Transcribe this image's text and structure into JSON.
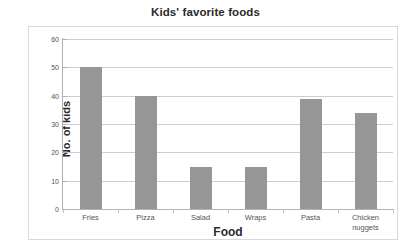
{
  "chart_data": {
    "type": "bar",
    "title": "Kids' favorite foods",
    "xlabel": "Food",
    "ylabel": "No. of kids",
    "categories": [
      "Fries",
      "Pizza",
      "Salad",
      "Wraps",
      "Pasta",
      "Chicken nuggets"
    ],
    "category_lines": [
      [
        "Fries"
      ],
      [
        "Pizza"
      ],
      [
        "Salad"
      ],
      [
        "Wraps"
      ],
      [
        "Pasta"
      ],
      [
        "Chicken",
        "nuggets"
      ]
    ],
    "values": [
      50,
      40,
      15,
      15,
      39,
      34
    ],
    "ylim": [
      0,
      60
    ],
    "ytick_step": 10,
    "yticks": [
      "60",
      "50",
      "40",
      "30",
      "20",
      "10",
      "0"
    ],
    "ytick_values": [
      60,
      50,
      40,
      30,
      20,
      10,
      0
    ],
    "grid": true,
    "legend": false,
    "bar_color": "#969696",
    "grid_color": "#cdcdcd",
    "frame_color": "#d9d9d9",
    "text_color": "#2b2b2b"
  }
}
